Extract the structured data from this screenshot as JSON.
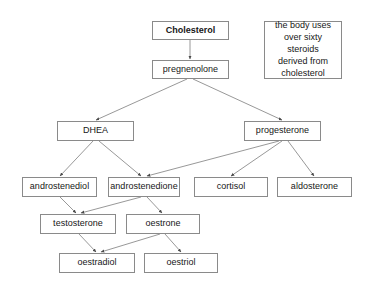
{
  "diagram": {
    "background_color": "#ffffff",
    "line_color": "#7d7d7d",
    "box_border_color": "#8a8a8a",
    "text_color": "#171717",
    "nodes": [
      {
        "id": "cholesterol",
        "label": "Cholesterol",
        "bold": true,
        "x": 152,
        "y": 21,
        "w": 77,
        "h": 19
      },
      {
        "id": "pregnenolone",
        "label": "pregnenolone",
        "bold": false,
        "x": 152,
        "y": 60,
        "w": 77,
        "h": 19
      },
      {
        "id": "dhea",
        "label": "DHEA",
        "bold": false,
        "x": 57,
        "y": 121,
        "w": 77,
        "h": 20
      },
      {
        "id": "progesterone",
        "label": "progesterone",
        "bold": false,
        "x": 244,
        "y": 121,
        "w": 77,
        "h": 20
      },
      {
        "id": "androstenediol",
        "label": "androstenediol",
        "bold": false,
        "x": 22,
        "y": 177,
        "w": 75,
        "h": 20
      },
      {
        "id": "androstenedione",
        "label": "androstenedione",
        "bold": false,
        "x": 108,
        "y": 177,
        "w": 72,
        "h": 20
      },
      {
        "id": "cortisol",
        "label": "cortisol",
        "bold": false,
        "x": 194,
        "y": 177,
        "w": 74,
        "h": 20
      },
      {
        "id": "aldosterone",
        "label": "aldosterone",
        "bold": false,
        "x": 277,
        "y": 177,
        "w": 75,
        "h": 20
      },
      {
        "id": "testosterone",
        "label": "testosterone",
        "bold": false,
        "x": 40,
        "y": 214,
        "w": 76,
        "h": 20
      },
      {
        "id": "oestrone",
        "label": "oestrone",
        "bold": false,
        "x": 126,
        "y": 214,
        "w": 74,
        "h": 20
      },
      {
        "id": "oestradiol",
        "label": "oestradiol",
        "bold": false,
        "x": 59,
        "y": 253,
        "w": 76,
        "h": 20
      },
      {
        "id": "oestriol",
        "label": "oestriol",
        "bold": false,
        "x": 144,
        "y": 253,
        "w": 74,
        "h": 20
      }
    ],
    "edges": [
      {
        "from": "cholesterol",
        "to": "pregnenolone",
        "x1": 190,
        "y1": 40,
        "x2": 190,
        "y2": 59
      },
      {
        "from": "pregnenolone",
        "to": "dhea",
        "x1": 187,
        "y1": 79,
        "x2": 96,
        "y2": 120
      },
      {
        "from": "pregnenolone",
        "to": "progesterone",
        "x1": 193,
        "y1": 79,
        "x2": 282,
        "y2": 120
      },
      {
        "from": "dhea",
        "to": "androstenediol",
        "x1": 93,
        "y1": 141,
        "x2": 60,
        "y2": 176
      },
      {
        "from": "dhea",
        "to": "androstenedione",
        "x1": 99,
        "y1": 141,
        "x2": 141,
        "y2": 176
      },
      {
        "from": "progesterone",
        "to": "androstenedione",
        "x1": 279,
        "y1": 141,
        "x2": 147,
        "y2": 176
      },
      {
        "from": "progesterone",
        "to": "cortisol",
        "x1": 282,
        "y1": 141,
        "x2": 231,
        "y2": 176
      },
      {
        "from": "progesterone",
        "to": "aldosterone",
        "x1": 288,
        "y1": 141,
        "x2": 314,
        "y2": 176
      },
      {
        "from": "androstenediol",
        "to": "testosterone",
        "x1": 60,
        "y1": 197,
        "x2": 76,
        "y2": 213
      },
      {
        "from": "androstenedione",
        "to": "testosterone",
        "x1": 141,
        "y1": 197,
        "x2": 81,
        "y2": 213
      },
      {
        "from": "androstenedione",
        "to": "oestrone",
        "x1": 147,
        "y1": 197,
        "x2": 162,
        "y2": 213
      },
      {
        "from": "testosterone",
        "to": "oestradiol",
        "x1": 79,
        "y1": 234,
        "x2": 96,
        "y2": 252
      },
      {
        "from": "oestrone",
        "to": "oestradiol",
        "x1": 160,
        "y1": 234,
        "x2": 101,
        "y2": 252
      },
      {
        "from": "oestrone",
        "to": "oestriol",
        "x1": 165,
        "y1": 234,
        "x2": 181,
        "y2": 252
      }
    ],
    "note": {
      "id": "note-cholesterol-usage",
      "text": "the body uses\nover sixty steroids\nderived from\ncholesterol",
      "x": 264,
      "y": 21,
      "w": 78,
      "h": 58
    }
  }
}
